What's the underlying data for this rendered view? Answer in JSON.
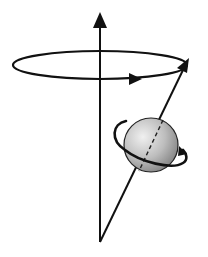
{
  "diagram": {
    "type": "precession-diagram",
    "colors": {
      "background": "#ffffff",
      "stroke": "#111111",
      "sphere_light": "#e8e8e8",
      "sphere_dark": "#8a8a8a"
    },
    "elements": {
      "vertical_axis": {
        "x": 100,
        "y_top": 14,
        "y_bottom": 242
      },
      "precession_ellipse": {
        "cx": 100,
        "cy": 65,
        "rx": 87,
        "ry": 14
      },
      "spin_vector": {
        "x1": 100,
        "y1": 242,
        "x2": 188,
        "y2": 60
      },
      "sphere": {
        "cx": 151,
        "cy": 145,
        "r": 27
      }
    },
    "labels": []
  }
}
